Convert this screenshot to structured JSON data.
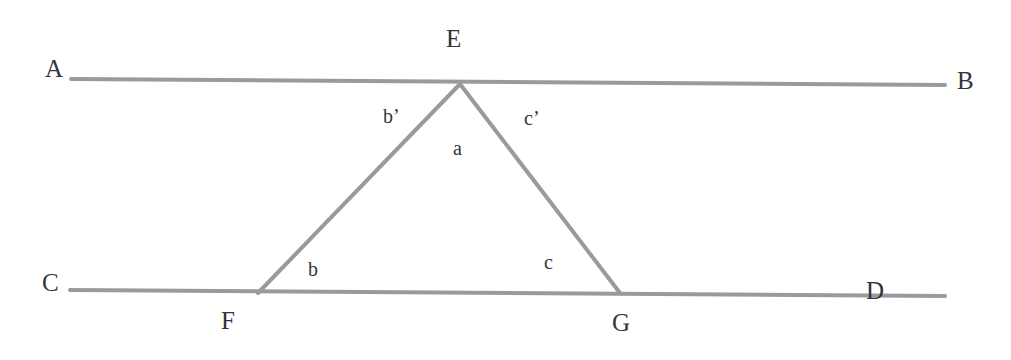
{
  "figure": {
    "kind": "geometry-diagram",
    "background_color": "#ffffff",
    "line_color": "#9a9a9e",
    "label_color": "#33343a"
  },
  "points": {
    "A": {
      "label": "A",
      "x": 45,
      "y": 56
    },
    "B": {
      "label": "B",
      "x": 957,
      "y": 68
    },
    "C": {
      "label": "C",
      "x": 42,
      "y": 270
    },
    "D": {
      "label": "D",
      "x": 866,
      "y": 278
    },
    "E": {
      "label": "E",
      "x": 446,
      "y": 26
    },
    "F": {
      "label": "F",
      "x": 221,
      "y": 308
    },
    "G": {
      "label": "G",
      "x": 612,
      "y": 310
    }
  },
  "side_labels": {
    "b_prime": {
      "label": "b’",
      "x": 383,
      "y": 106
    },
    "c_prime": {
      "label": "c’",
      "x": 524,
      "y": 108
    },
    "a": {
      "label": "a",
      "x": 453,
      "y": 138
    },
    "b": {
      "label": "b",
      "x": 308,
      "y": 259
    },
    "c": {
      "label": "c",
      "x": 544,
      "y": 252
    }
  },
  "segments": {
    "line_AB": {
      "name": "line-AB",
      "x1": 71,
      "y1": 79,
      "x2": 945,
      "y2": 85,
      "width": 4
    },
    "line_CD": {
      "name": "line-CD",
      "x1": 70,
      "y1": 290,
      "x2": 945,
      "y2": 296,
      "width": 4
    },
    "side_EF": {
      "name": "side-EF",
      "x1": 460,
      "y1": 84,
      "x2": 258,
      "y2": 293,
      "width": 4
    },
    "side_EG": {
      "name": "side-EG",
      "x1": 460,
      "y1": 84,
      "x2": 620,
      "y2": 293,
      "width": 4
    }
  }
}
